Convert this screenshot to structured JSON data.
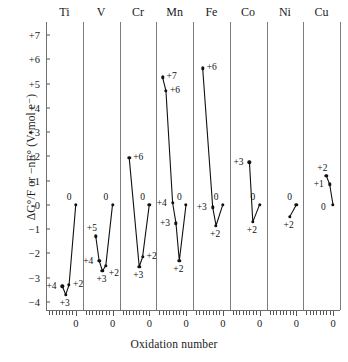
{
  "chart_data": {
    "type": "line",
    "title": "",
    "xlabel": "Oxidation number",
    "ylabel": "ΔG°/F or −nE°  (V•mol e⁻)",
    "ylim": [
      -4,
      7
    ],
    "ytick_labels": [
      "+7",
      "+6",
      "+5",
      "+4",
      "+3",
      "+2",
      "+1",
      "0",
      "−1",
      "−2",
      "−3",
      "−4"
    ],
    "ytick_values": [
      7,
      6,
      5,
      4,
      3,
      2,
      1,
      0,
      -1,
      -2,
      -3,
      -4
    ],
    "xtick_label_each_panel": "0",
    "grid": false,
    "legend": "none",
    "panels": [
      {
        "name": "Ti",
        "points": [
          {
            "ox": 4,
            "label": "+4",
            "value": -3.35,
            "lpos": "left"
          },
          {
            "ox": 3,
            "label": "+3",
            "value": -3.7,
            "lpos": "below"
          },
          {
            "ox": 2,
            "label": "+2",
            "value": -3.3,
            "lpos": "right"
          },
          {
            "ox": 0,
            "label": "0",
            "value": 0.0,
            "lpos": "above-left"
          }
        ]
      },
      {
        "name": "V",
        "points": [
          {
            "ox": 5,
            "label": "+5",
            "value": -1.3,
            "lpos": "above-left"
          },
          {
            "ox": 4,
            "label": "+4",
            "value": -2.3,
            "lpos": "left"
          },
          {
            "ox": 3,
            "label": "+3",
            "value": -2.72,
            "lpos": "below"
          },
          {
            "ox": 2,
            "label": "+2",
            "value": -2.5,
            "lpos": "below-right"
          },
          {
            "ox": 0,
            "label": "0",
            "value": 0.0,
            "lpos": "above-left"
          }
        ]
      },
      {
        "name": "Cr",
        "points": [
          {
            "ox": 6,
            "label": "+6",
            "value": 1.95,
            "lpos": "right"
          },
          {
            "ox": 3,
            "label": "+3",
            "value": -2.55,
            "lpos": "below"
          },
          {
            "ox": 2,
            "label": "+2",
            "value": -2.15,
            "lpos": "right"
          },
          {
            "ox": 0,
            "label": "0",
            "value": 0.0,
            "lpos": "above-left"
          }
        ]
      },
      {
        "name": "Mn",
        "points": [
          {
            "ox": 7,
            "label": "+7",
            "value": 5.25,
            "lpos": "right"
          },
          {
            "ox": 6,
            "label": "+6",
            "value": 4.7,
            "lpos": "right"
          },
          {
            "ox": 4,
            "label": "+4",
            "value": 0.08,
            "lpos": "left"
          },
          {
            "ox": 3,
            "label": "+3",
            "value": -0.75,
            "lpos": "left"
          },
          {
            "ox": 2,
            "label": "+2",
            "value": -2.3,
            "lpos": "below"
          },
          {
            "ox": 0,
            "label": "0",
            "value": 0.0,
            "lpos": "above-left"
          }
        ]
      },
      {
        "name": "Fe",
        "points": [
          {
            "ox": 6,
            "label": "+6",
            "value": 5.62,
            "lpos": "right"
          },
          {
            "ox": 3,
            "label": "+3",
            "value": -0.1,
            "lpos": "left"
          },
          {
            "ox": 2,
            "label": "+2",
            "value": -0.85,
            "lpos": "below"
          },
          {
            "ox": 0,
            "label": "0",
            "value": 0.0,
            "lpos": "above-left"
          }
        ]
      },
      {
        "name": "Co",
        "points": [
          {
            "ox": 3,
            "label": "+3",
            "value": 1.75,
            "lpos": "left"
          },
          {
            "ox": 2,
            "label": "+2",
            "value": -0.7,
            "lpos": "below"
          },
          {
            "ox": 0,
            "label": "0",
            "value": 0.0,
            "lpos": "above-left"
          }
        ]
      },
      {
        "name": "Ni",
        "points": [
          {
            "ox": 2,
            "label": "+2",
            "value": -0.5,
            "lpos": "below"
          },
          {
            "ox": 0,
            "label": "0",
            "value": 0.0,
            "lpos": "above-left"
          }
        ]
      },
      {
        "name": "Cu",
        "points": [
          {
            "ox": 2,
            "label": "+2",
            "value": 1.2,
            "lpos": "above-left"
          },
          {
            "ox": 1,
            "label": "+1",
            "value": 0.85,
            "lpos": "left"
          },
          {
            "ox": 0,
            "label": "0",
            "value": 0.0,
            "lpos": "below-left"
          }
        ]
      }
    ]
  }
}
